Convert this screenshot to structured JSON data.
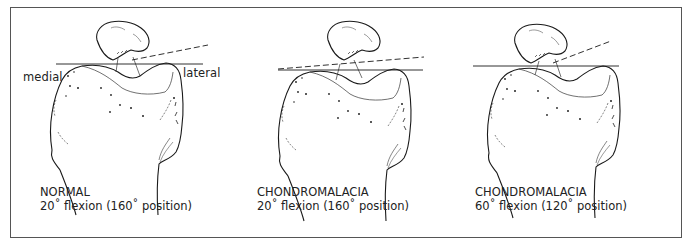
{
  "figure": {
    "panels": [
      {
        "id": "normal-20",
        "title": "NORMAL",
        "subtitle": "20˚ flexion (160˚ position)",
        "labels": {
          "medial": "medial",
          "lateral": "lateral"
        },
        "reference_line": "solid horizontal",
        "patellar_line": "dashed, tilted up laterally"
      },
      {
        "id": "chondromalacia-20",
        "title": "CHONDROMALACIA",
        "subtitle": "20˚ flexion (160˚ position)",
        "reference_line": "solid horizontal",
        "patellar_line": "dashed, slightly tilted"
      },
      {
        "id": "chondromalacia-60",
        "title": "CHONDROMALACIA",
        "subtitle": "60˚ flexion (120˚ position)",
        "reference_line": "solid horizontal",
        "patellar_line": "dashed, tilted up laterally"
      }
    ],
    "colors": {
      "line": "#1a1a1a",
      "frame": "#555555",
      "background": "#ffffff"
    }
  }
}
